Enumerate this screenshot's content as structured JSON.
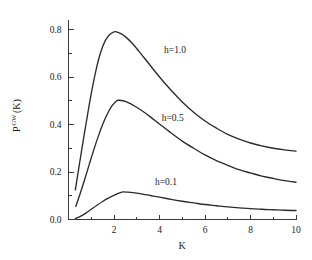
{
  "chart_data": {
    "type": "line",
    "title": "",
    "subtitle": "",
    "xlabel": "K",
    "ylabel": "P^GW(K)",
    "ylabel_base": "P",
    "ylabel_superscript": "GW",
    "ylabel_argument": "(K)",
    "xlim": [
      0,
      10
    ],
    "ylim": [
      0,
      0.84
    ],
    "grid": false,
    "legend_position": "inline-annotations",
    "xticks": [
      2,
      4,
      6,
      8,
      10
    ],
    "xtick_labels": [
      "2",
      "4",
      "6",
      "8",
      "10"
    ],
    "xticks_minor": [
      1,
      3,
      5,
      7,
      9
    ],
    "yticks": [
      0.0,
      0.2,
      0.4,
      0.6,
      0.8
    ],
    "ytick_labels": [
      "0.0",
      "0.2",
      "0.4",
      "0.6",
      "0.8"
    ],
    "yticks_minor": [
      0.1,
      0.3,
      0.5,
      0.7
    ],
    "annotations": [
      {
        "text": "h=1.0",
        "x": 4.2,
        "y": 0.7
      },
      {
        "text": "h=0.5",
        "x": 4.1,
        "y": 0.415
      },
      {
        "text": "h=0.1",
        "x": 3.8,
        "y": 0.145
      }
    ],
    "series": [
      {
        "name": "h=1.0",
        "h": 1.0,
        "peak_x": 2.1,
        "peak_y": 0.79,
        "x": [
          0.3,
          0.45,
          0.6,
          0.8,
          1.0,
          1.2,
          1.4,
          1.6,
          1.8,
          2.0,
          2.1,
          2.3,
          2.5,
          2.8,
          3.1,
          3.5,
          4.0,
          4.5,
          5.0,
          5.5,
          6.0,
          6.5,
          7.0,
          7.5,
          8.0,
          8.5,
          9.0,
          9.5,
          10.0
        ],
        "y": [
          0.125,
          0.215,
          0.305,
          0.42,
          0.53,
          0.625,
          0.7,
          0.75,
          0.778,
          0.79,
          0.79,
          0.783,
          0.77,
          0.742,
          0.708,
          0.66,
          0.6,
          0.545,
          0.495,
          0.452,
          0.415,
          0.385,
          0.358,
          0.338,
          0.322,
          0.31,
          0.3,
          0.293,
          0.288
        ]
      },
      {
        "name": "h=0.5",
        "h": 0.5,
        "peak_x": 2.2,
        "peak_y": 0.502,
        "x": [
          0.32,
          0.5,
          0.7,
          0.9,
          1.1,
          1.3,
          1.5,
          1.7,
          1.9,
          2.1,
          2.2,
          2.4,
          2.6,
          2.9,
          3.2,
          3.6,
          4.0,
          4.5,
          5.0,
          5.5,
          6.0,
          6.5,
          7.0,
          7.5,
          8.0,
          8.5,
          9.0,
          9.5,
          10.0
        ],
        "y": [
          0.055,
          0.105,
          0.165,
          0.228,
          0.29,
          0.348,
          0.4,
          0.443,
          0.477,
          0.498,
          0.502,
          0.5,
          0.493,
          0.478,
          0.46,
          0.432,
          0.402,
          0.365,
          0.33,
          0.3,
          0.272,
          0.248,
          0.228,
          0.21,
          0.196,
          0.183,
          0.173,
          0.164,
          0.157
        ]
      },
      {
        "name": "h=0.1",
        "h": 0.1,
        "peak_x": 2.4,
        "peak_y": 0.116,
        "x": [
          0.3,
          0.5,
          0.75,
          1.0,
          1.25,
          1.5,
          1.75,
          2.0,
          2.25,
          2.4,
          2.6,
          2.9,
          3.2,
          3.6,
          4.0,
          4.5,
          5.0,
          5.5,
          6.0,
          6.5,
          7.0,
          7.5,
          8.0,
          8.5,
          9.0,
          9.5,
          10.0
        ],
        "y": [
          0.004,
          0.012,
          0.026,
          0.043,
          0.06,
          0.076,
          0.09,
          0.102,
          0.112,
          0.116,
          0.115,
          0.112,
          0.108,
          0.101,
          0.094,
          0.085,
          0.077,
          0.07,
          0.063,
          0.058,
          0.053,
          0.049,
          0.046,
          0.043,
          0.041,
          0.039,
          0.038
        ]
      }
    ]
  },
  "figure": {
    "background_color": "#ffffff",
    "line_color": "#2b2b2b",
    "axis_color": "#3a3a3a",
    "text_color": "#1a1a1a"
  }
}
